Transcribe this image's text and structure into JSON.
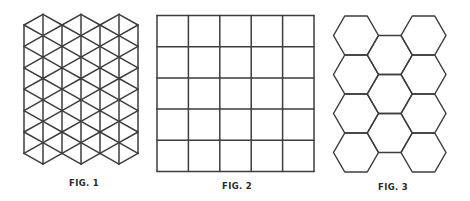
{
  "figures": [
    {
      "id": "fig1",
      "label": "FIG. 1",
      "pattern": "triangular-grid",
      "label_pos": {
        "x": 84,
        "y": 178
      },
      "grid": {
        "x0": 24,
        "col_step": 19,
        "columns": 7,
        "even_y0": 25,
        "odd_y0": 14.3,
        "row_step": 21.4,
        "even_rows": 6,
        "odd_rows": 7
      }
    },
    {
      "id": "fig2",
      "label": "FIG. 2",
      "pattern": "square-grid",
      "label_pos": {
        "x": 237,
        "y": 181
      },
      "grid": {
        "x": 157,
        "y": 15.5,
        "width": 157,
        "height": 156,
        "rows": 5,
        "cols": 5
      }
    },
    {
      "id": "fig3",
      "label": "FIG. 3",
      "pattern": "hexagonal-grid",
      "label_pos": {
        "x": 393,
        "y": 182
      },
      "grid": {
        "side": 22.5,
        "hex_height": 39,
        "x0": 333.5,
        "col_step": 33.75,
        "columns": [
          {
            "top": 16,
            "count": 4
          },
          {
            "top": 35.5,
            "count": 3
          },
          {
            "top": 16,
            "count": 4
          }
        ]
      }
    }
  ],
  "style": {
    "stroke": "#3d3d3d",
    "background": "#ffffff"
  }
}
